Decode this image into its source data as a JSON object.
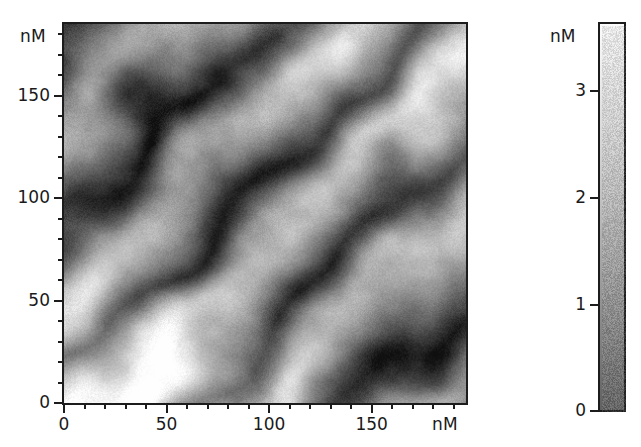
{
  "figure": {
    "type": "afm-topography-image",
    "background": "#ffffff"
  },
  "axes": {
    "x": {
      "unit_label": "nM",
      "tick_labels": [
        "0",
        "50",
        "100",
        "150"
      ],
      "tick_values": [
        0,
        50,
        100,
        150
      ],
      "minor_step": 10,
      "range": [
        0,
        196
      ]
    },
    "y": {
      "unit_label": "nM",
      "tick_labels": [
        "0",
        "50",
        "100",
        "150"
      ],
      "tick_values": [
        0,
        50,
        100,
        150
      ],
      "minor_step": 10,
      "range": [
        0,
        185
      ]
    }
  },
  "colorbar": {
    "unit_label": "nM",
    "tick_labels": [
      "0",
      "1",
      "2",
      "3"
    ],
    "tick_values": [
      0,
      1,
      2,
      3
    ],
    "range": [
      0,
      3.65
    ],
    "low_color": "#5e5e5e",
    "high_color": "#fcfcfc",
    "orientation": "vertical"
  },
  "chart_data": {
    "type": "heatmap",
    "title": "",
    "xlabel": "nM",
    "ylabel": "nM",
    "zlabel": "nM",
    "xlim": [
      0,
      196
    ],
    "ylim": [
      0,
      185
    ],
    "zlim": [
      0,
      3.65
    ],
    "colormap": "grayscale",
    "grid": false,
    "legend": "colorbar-right",
    "features": {
      "stripe_orientation_deg": -45,
      "stripe_period_nm": 78,
      "stripe_count": 3,
      "mean_height_nm": 2.1,
      "noise_amplitude_nm": 0.14,
      "dark_band_centers_nm": [
        {
          "x": 55,
          "y": 140
        },
        {
          "x": 150,
          "y": 150
        },
        {
          "x": 100,
          "y": 35
        }
      ]
    },
    "tick_labels": {
      "x": [
        "0",
        "50",
        "100",
        "150"
      ],
      "y": [
        "0",
        "50",
        "100",
        "150"
      ],
      "z": [
        "0",
        "1",
        "2",
        "3"
      ]
    }
  }
}
